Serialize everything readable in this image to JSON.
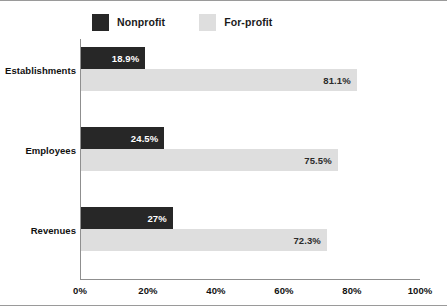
{
  "chart_data": {
    "type": "bar",
    "orientation": "horizontal",
    "title": "",
    "xlabel": "",
    "ylabel": "",
    "categories": [
      "Establishments",
      "Employees",
      "Revenues"
    ],
    "series": [
      {
        "name": "Nonprofit",
        "color": "#272727",
        "values": [
          18.9,
          24.5,
          27
        ],
        "labels": [
          "18.9%",
          "24.5%",
          "27%"
        ]
      },
      {
        "name": "For-profit",
        "color": "#dedede",
        "values": [
          81.1,
          75.5,
          72.3
        ],
        "labels": [
          "81.1%",
          "75.5%",
          "72.3%"
        ]
      }
    ],
    "xlim": [
      0,
      100
    ],
    "xticks": [
      0,
      20,
      40,
      60,
      80,
      100
    ],
    "xtick_labels": [
      "0%",
      "20%",
      "40%",
      "60%",
      "80%",
      "100%"
    ],
    "grid": false,
    "legend_position": "top"
  },
  "legend": {
    "items": [
      {
        "label": "Nonprofit",
        "swatch_name": "legend-swatch-nonprofit"
      },
      {
        "label": "For-profit",
        "swatch_name": "legend-swatch-forprofit"
      }
    ]
  },
  "colors": {
    "nonprofit": "#272727",
    "forprofit": "#dedede",
    "axis": "#8f8f8f",
    "border": "#9a9a9a",
    "text": "#111111",
    "bar_value_light": "#ffffff",
    "bar_value_dark": "#2b2b2b"
  }
}
